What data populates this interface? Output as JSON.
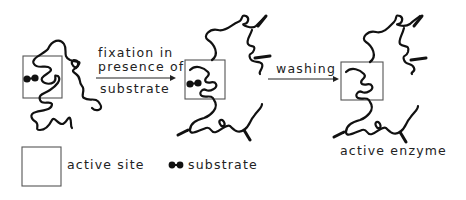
{
  "diagram": {
    "stages": [
      {
        "id": "native-enzyme",
        "has_substrate": true,
        "crosslinked": false
      },
      {
        "id": "fixed-enzyme",
        "has_substrate": true,
        "crosslinked": true
      },
      {
        "id": "active-enzyme",
        "has_substrate": false,
        "crosslinked": true,
        "label": "active enzyme"
      }
    ],
    "arrows": [
      {
        "from": "native-enzyme",
        "to": "fixed-enzyme",
        "label_lines": [
          "fixation in",
          "presence of",
          "substrate"
        ]
      },
      {
        "from": "fixed-enzyme",
        "to": "active-enzyme",
        "label_lines": [
          "washing"
        ]
      }
    ],
    "legend": {
      "active_site": "active site",
      "substrate": "substrate"
    },
    "colors": {
      "line": "#111111",
      "box": "#555555",
      "text": "#222222",
      "background": "#ffffff"
    }
  }
}
